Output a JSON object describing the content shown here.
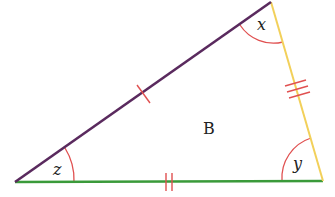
{
  "diagram": {
    "type": "triangle",
    "name": "B",
    "vertices": {
      "top": [
        271,
        2
      ],
      "bottom_left": [
        15,
        182
      ],
      "bottom_right": [
        323,
        181
      ]
    },
    "sides": [
      {
        "id": "left",
        "from": "bottom_left",
        "to": "top",
        "color": "#5a2a5e",
        "tick_marks": 1
      },
      {
        "id": "right",
        "from": "top",
        "to": "bottom_right",
        "color": "#f2d05a",
        "tick_marks": 3
      },
      {
        "id": "bottom",
        "from": "bottom_left",
        "to": "bottom_right",
        "color": "#3a9a3a",
        "tick_marks": 2
      }
    ],
    "angles": [
      {
        "vertex": "top",
        "label": "x"
      },
      {
        "vertex": "bottom_right",
        "label": "y"
      },
      {
        "vertex": "bottom_left",
        "label": "z"
      }
    ],
    "tick_color": "#e05050",
    "arc_color": "#e05050"
  },
  "labels": {
    "angle_x": "x",
    "angle_y": "y",
    "angle_z": "z",
    "triangle": "B"
  }
}
